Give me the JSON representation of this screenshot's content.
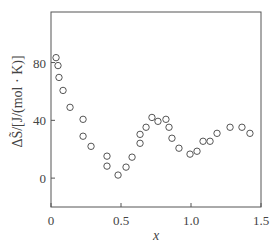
{
  "chart_data": {
    "type": "scatter",
    "title": "",
    "xlabel": "x",
    "ylabel": "ΔS̃/[J/(mol · K)]",
    "xlim": [
      0,
      1.5
    ],
    "ylim": [
      -20,
      115
    ],
    "xticks": [
      0,
      0.5,
      1.0,
      1.5
    ],
    "xtick_labels": [
      "0",
      "0.5",
      "1.0",
      "1.5"
    ],
    "yticks": [
      0,
      40,
      80
    ],
    "ytick_labels": [
      "0",
      "40",
      "80"
    ],
    "grid": false,
    "legend": null,
    "marker": "open-circle",
    "series": [
      {
        "name": "ΔS",
        "points": [
          [
            0.036,
            83.4
          ],
          [
            0.05,
            77.9
          ],
          [
            0.057,
            69.7
          ],
          [
            0.086,
            60.7
          ],
          [
            0.136,
            49.0
          ],
          [
            0.229,
            40.7
          ],
          [
            0.229,
            29.0
          ],
          [
            0.286,
            22.0
          ],
          [
            0.4,
            15.2
          ],
          [
            0.4,
            8.3
          ],
          [
            0.479,
            2.1
          ],
          [
            0.536,
            7.6
          ],
          [
            0.579,
            14.5
          ],
          [
            0.636,
            24.1
          ],
          [
            0.636,
            30.3
          ],
          [
            0.679,
            35.2
          ],
          [
            0.721,
            42.0
          ],
          [
            0.764,
            39.3
          ],
          [
            0.821,
            40.7
          ],
          [
            0.843,
            35.2
          ],
          [
            0.864,
            27.6
          ],
          [
            0.914,
            20.7
          ],
          [
            0.993,
            16.6
          ],
          [
            1.043,
            18.6
          ],
          [
            1.086,
            25.5
          ],
          [
            1.136,
            25.5
          ],
          [
            1.186,
            31.0
          ],
          [
            1.279,
            35.2
          ],
          [
            1.364,
            35.2
          ],
          [
            1.421,
            31.0
          ]
        ]
      }
    ]
  },
  "layout": {
    "plot_left": 51,
    "plot_right": 261,
    "plot_top": 12,
    "plot_bottom": 207,
    "axis_color": "#555555",
    "marker_color": "#555555"
  }
}
